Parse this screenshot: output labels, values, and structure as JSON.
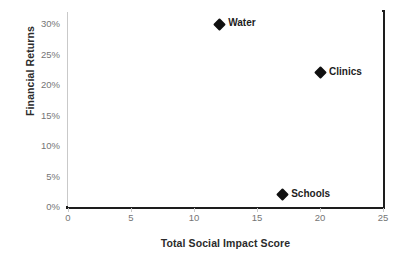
{
  "chart_data": {
    "type": "scatter",
    "title": "",
    "xlabel": "Total Social Impact Score",
    "ylabel": "Financial Returns",
    "xlim": [
      0,
      25
    ],
    "ylim": [
      0,
      32
    ],
    "grid": false,
    "legend": "none",
    "xticks": [
      "0",
      "5",
      "10",
      "15",
      "20",
      "25"
    ],
    "xtick_values": [
      0,
      5,
      10,
      15,
      20,
      25
    ],
    "yticks": [
      "0%",
      "5%",
      "10%",
      "15%",
      "20%",
      "25%",
      "30%"
    ],
    "ytick_values": [
      0,
      5,
      10,
      15,
      20,
      25,
      30
    ],
    "marker": "diamond",
    "marker_color": "#101010",
    "points": [
      {
        "label": "Water",
        "x": 12,
        "y": 30
      },
      {
        "label": "Clinics",
        "x": 20,
        "y": 22
      },
      {
        "label": "Schools",
        "x": 17,
        "y": 2
      }
    ]
  },
  "colors": {
    "background": "#ffffff",
    "marker": "#101010",
    "tick_text": "#757575",
    "axis_title": "#2b2b2b",
    "spine_dark": "#1d1d1d",
    "spine_light": "#c9c9c9"
  }
}
